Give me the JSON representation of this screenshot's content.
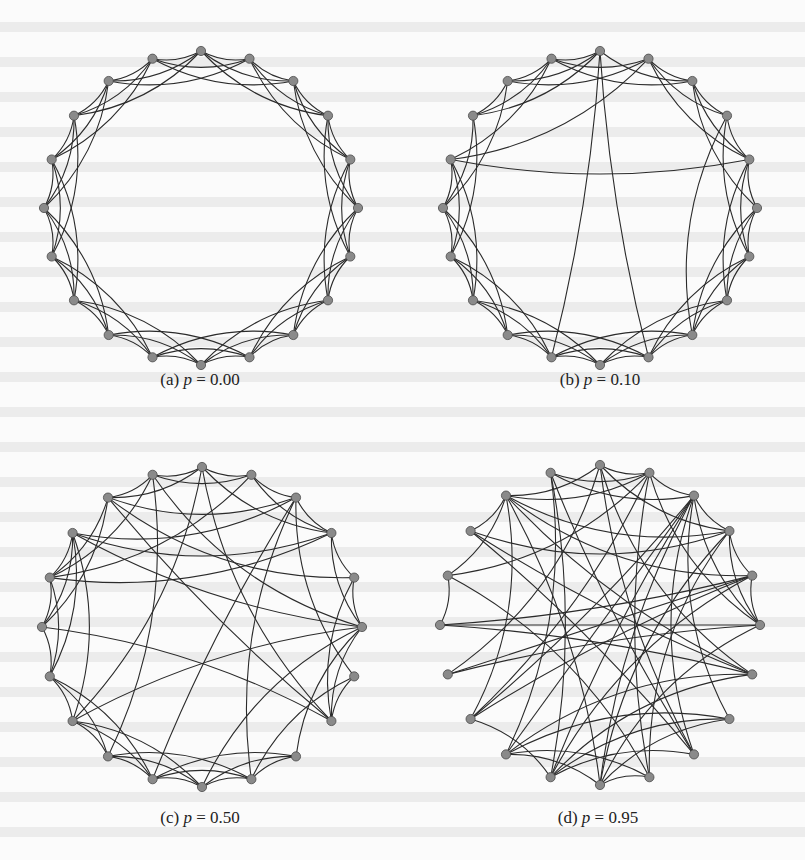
{
  "figure": {
    "panels": [
      {
        "id": "a",
        "label": "(a)",
        "p_symbol": "p",
        "p_value": "0.00",
        "cx": 201,
        "cy": 208,
        "r": 157,
        "caption_x": 200,
        "caption_y": 380,
        "seed": 0,
        "rewire_p": 0.0
      },
      {
        "id": "b",
        "label": "(b)",
        "p_symbol": "p",
        "p_value": "0.10",
        "cx": 600,
        "cy": 208,
        "r": 157,
        "caption_x": 600,
        "caption_y": 380,
        "seed": 7,
        "rewire_p": 0.1
      },
      {
        "id": "c",
        "label": "(c)",
        "p_symbol": "p",
        "p_value": "0.50",
        "cx": 202,
        "cy": 627,
        "r": 160,
        "caption_x": 200,
        "caption_y": 818,
        "seed": 13,
        "rewire_p": 0.5
      },
      {
        "id": "d",
        "label": "(d)",
        "p_symbol": "p",
        "p_value": "0.95",
        "cx": 600,
        "cy": 625,
        "r": 160,
        "caption_x": 598,
        "caption_y": 818,
        "seed": 29,
        "rewire_p": 0.95
      }
    ],
    "nodes_per_graph": 20,
    "neighbors_each_side": 3,
    "node_fill": "#8a8a8a",
    "node_stroke": "#4a4a4a",
    "edge_color": "#2b2b2b"
  }
}
